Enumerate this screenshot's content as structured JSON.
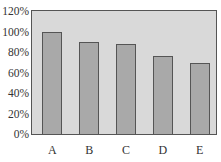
{
  "chart_data": {
    "type": "bar",
    "title": "",
    "xlabel": "",
    "ylabel": "",
    "categories": [
      "A",
      "B",
      "C",
      "D",
      "E"
    ],
    "values": [
      100,
      90,
      88,
      76,
      69
    ],
    "value_unit": "%",
    "ylim": [
      0,
      120
    ],
    "yticks": [
      "0%",
      "20%",
      "40%",
      "60%",
      "80%",
      "100%",
      "120%"
    ],
    "grid": false,
    "legend": null,
    "colors": {
      "plot_background": "#d9d9d9",
      "bar_fill": "#a9a9a9",
      "bar_border": "#555555"
    }
  }
}
